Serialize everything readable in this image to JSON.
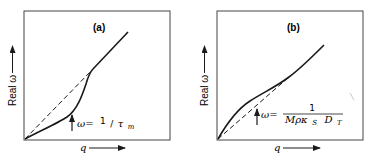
{
  "figure": {
    "panels": [
      {
        "id": "a",
        "label": "(a)",
        "y_axis_label": "Real ω",
        "x_axis_label": "q",
        "annotation": {
          "lhs": "ω=",
          "numerator": "1",
          "slash": "/",
          "symbol": "τ",
          "subscript": "m"
        }
      },
      {
        "id": "b",
        "label": "(b)",
        "y_axis_label": "Real ω",
        "x_axis_label": "q",
        "annotation": {
          "lhs": "ω=",
          "numerator": "1",
          "denominator_main": "Mρκ",
          "denominator_sub1": "S",
          "denominator_d": "D",
          "denominator_sub2": "T"
        }
      }
    ],
    "colors": {
      "line": "#1a1a1a",
      "frame": "#333333",
      "background": "#ffffff"
    }
  }
}
